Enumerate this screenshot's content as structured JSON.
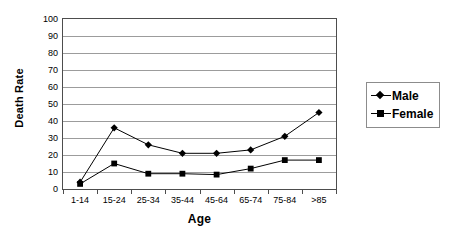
{
  "chart_data": {
    "type": "line",
    "title": "",
    "xlabel": "Age",
    "ylabel": "Death Rate",
    "categories": [
      "1-14",
      "15-24",
      "25-34",
      "35-44",
      "45-64",
      "65-74",
      "75-84",
      ">85"
    ],
    "series": [
      {
        "name": "Male",
        "marker": "diamond",
        "values": [
          4,
          36,
          26,
          21,
          21,
          23,
          31,
          45
        ]
      },
      {
        "name": "Female",
        "marker": "square",
        "values": [
          3,
          15,
          9,
          9,
          8.5,
          12,
          17,
          17
        ]
      }
    ],
    "ylim": [
      0,
      100
    ],
    "ytick_step": 10,
    "yticks": [
      "0",
      "10",
      "20",
      "30",
      "40",
      "50",
      "60",
      "70",
      "80",
      "90",
      "100"
    ],
    "grid": "horizontal",
    "legend_position": "right",
    "line_color": "#000000",
    "grid_color": "#9c9c9c",
    "axis_color": "#4d4d4d"
  },
  "legend": {
    "entries": [
      {
        "label": "Male"
      },
      {
        "label": "Female"
      }
    ]
  }
}
